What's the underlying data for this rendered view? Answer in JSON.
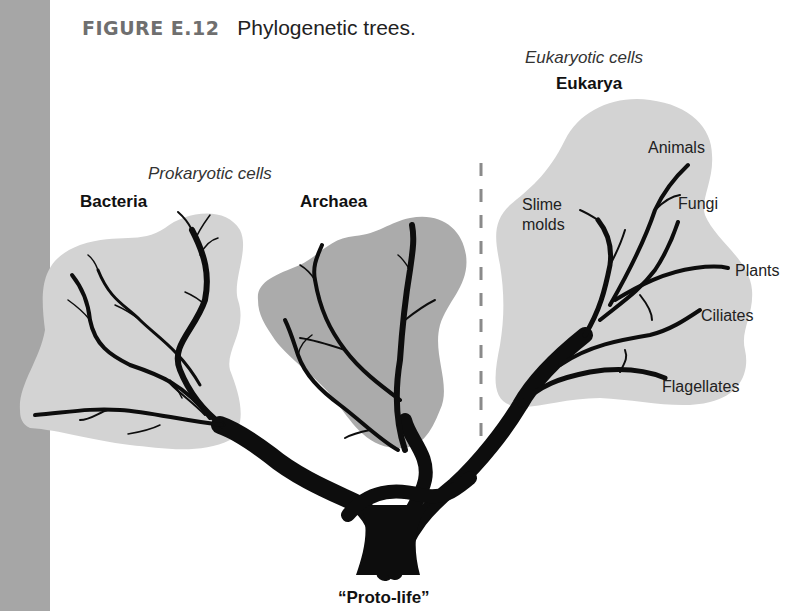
{
  "figure": {
    "number": "FIGURE E.12",
    "caption": "Phylogenetic trees."
  },
  "groups": {
    "prokaryotic": "Prokaryotic cells",
    "eukaryotic": "Eukaryotic cells"
  },
  "domains": {
    "bacteria": "Bacteria",
    "archaea": "Archaea",
    "eukarya": "Eukarya"
  },
  "eukarya_clades": {
    "slime_molds_1": "Slime",
    "slime_molds_2": "molds",
    "animals": "Animals",
    "fungi": "Fungi",
    "plants": "Plants",
    "ciliates": "Ciliates",
    "flagellates": "Flagellates"
  },
  "root": "“Proto-life”",
  "colors": {
    "side_bar": "#a6a6a6",
    "light_blob": "#d3d3d3",
    "dark_blob": "#ababab",
    "branch": "#0d0d0d",
    "divider": "#8a8a8a"
  }
}
